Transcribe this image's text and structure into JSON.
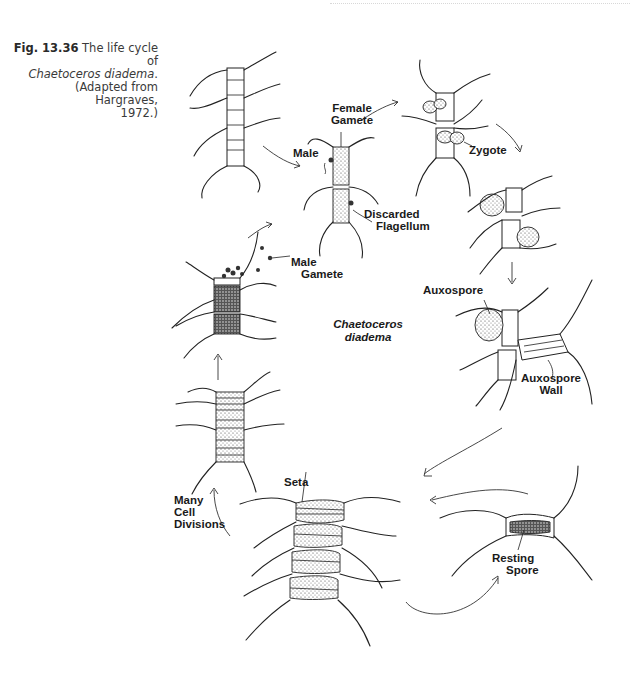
{
  "figure": {
    "number": "Fig. 13.36",
    "caption_line1": "The life cycle of",
    "caption_species": "Chaetoceros diadema",
    "caption_period": ".",
    "caption_line3": "(Adapted from Hargraves,",
    "caption_line4": "1972.)"
  },
  "diagram": {
    "title_line1": "Chaetoceros",
    "title_line2": "diadema",
    "labels": {
      "female_gamete_1": "Female",
      "female_gamete_2": "Gamete",
      "male": "Male",
      "discarded_flagellum_1": "Discarded",
      "discarded_flagellum_2": "Flagellum",
      "male_gamete_1": "Male",
      "male_gamete_2": "Gamete",
      "zygote": "Zygote",
      "auxospore": "Auxospore",
      "auxospore_wall_1": "Auxospore",
      "auxospore_wall_2": "Wall",
      "seta": "Seta",
      "many_cell_divisions_1": "Many",
      "many_cell_divisions_2": "Cell",
      "many_cell_divisions_3": "Divisions",
      "resting_spore_1": "Resting",
      "resting_spore_2": "Spore"
    },
    "stages": [
      "vegetative chain",
      "gametangia with male and female gametes",
      "zygote",
      "zygote enlargement",
      "auxospore with auxospore wall",
      "resting spore",
      "enlarged chain (many cell divisions)",
      "chain",
      "spermatogonia releasing male gametes"
    ]
  }
}
